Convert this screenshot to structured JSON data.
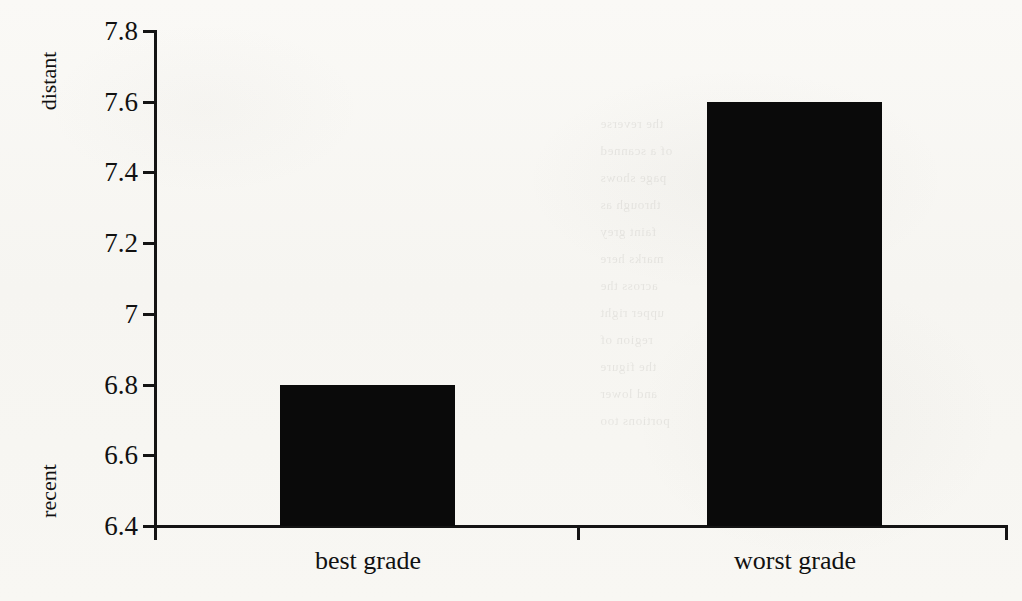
{
  "chart_data": {
    "type": "bar",
    "title": "",
    "xlabel": "",
    "ylabel": "",
    "categories": [
      "best grade",
      "worst grade"
    ],
    "values": [
      6.8,
      7.6
    ],
    "series": [
      {
        "name": "rating",
        "values": [
          6.8,
          7.6
        ]
      }
    ],
    "ylim": [
      6.4,
      7.8
    ],
    "yticks": [
      "6.4",
      "6.6",
      "6.8",
      "7",
      "7.2",
      "7.4",
      "7.6",
      "7.8"
    ],
    "ytick_values": [
      6.4,
      6.6,
      6.8,
      7.0,
      7.2,
      7.4,
      7.6,
      7.8
    ],
    "axis_endpoint_labels": {
      "low": "recent",
      "high": "distant"
    },
    "grid": false,
    "legend": false,
    "bar_color": "#0a0a0a",
    "background_color": "#f8f7f4",
    "axis_color": "#141414"
  },
  "axis": {
    "y_low_label": "recent",
    "y_high_label": "distant"
  },
  "bleed_text": "the reverse\nof a scanned\npage shows\nthrough as\nfaint grey\nmarks here\nacross the\nupper right\nregion of\nthe figure\nand lower\nportions too"
}
